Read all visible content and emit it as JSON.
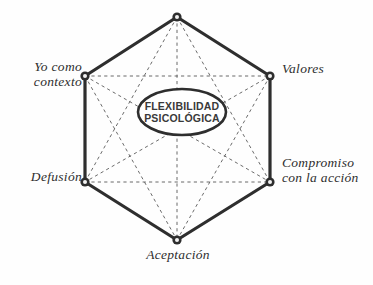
{
  "diagram": {
    "title_center_line1": "FLEXIBILIDAD",
    "title_center_line2": "PSICOLÓGICA",
    "background_color": "#fefefe",
    "line_color": "#2e2e2e",
    "dashed_line_color": "#5a5a5a",
    "node_fill_color": "#f2f2f2",
    "node_stroke_color": "#2e2e2e",
    "text_color": "#2e2e2e",
    "vertices": [
      {
        "id": "valores",
        "label": "Valores",
        "label_line1": "Valores",
        "label_line2": "",
        "x": 270,
        "y": 76,
        "position": "upper-right"
      },
      {
        "id": "compromiso",
        "label": "Compromiso con la acción",
        "label_line1": "Compromiso",
        "label_line2": "con la acción",
        "x": 270,
        "y": 182,
        "position": "lower-right"
      },
      {
        "id": "aceptacion",
        "label": "Aceptación",
        "label_line1": "Aceptación",
        "label_line2": "",
        "x": 177,
        "y": 240,
        "position": "bottom"
      },
      {
        "id": "defusion",
        "label": "Defusión",
        "label_line1": "Defusión",
        "label_line2": "",
        "x": 85,
        "y": 182,
        "position": "lower-left"
      },
      {
        "id": "yo-contexto",
        "label": "Yo como contexto",
        "label_line1": "Yo como",
        "label_line2": "contexto",
        "x": 85,
        "y": 76,
        "position": "upper-left"
      },
      {
        "id": "momento",
        "label": "",
        "label_line1": "",
        "label_line2": "",
        "x": 177,
        "y": 17,
        "position": "top"
      }
    ],
    "center_ellipse": {
      "cx": 182,
      "cy": 112,
      "rx": 44,
      "ry": 23
    }
  }
}
